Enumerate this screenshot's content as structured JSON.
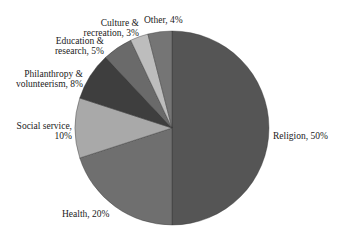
{
  "chart_data": {
    "type": "pie",
    "title": "",
    "start_angle": "12 o'clock",
    "direction": "clockwise",
    "categories": [
      "Religion",
      "Health",
      "Social service",
      "Philanthropy & volunteerism",
      "Education & research",
      "Culture & recreation",
      "Other"
    ],
    "values": [
      50,
      20,
      10,
      8,
      5,
      3,
      4
    ],
    "unit": "%",
    "colors": [
      "#555555",
      "#6f6f6f",
      "#a9a9a9",
      "#3e3e3e",
      "#6a6a6a",
      "#bdbdbd",
      "#757575"
    ],
    "legend": "none (direct labels)"
  },
  "labels": {
    "religion": "Religion, 50%",
    "health": "Health, 20%",
    "social_line1": "Social service,",
    "social_line2": "10%",
    "philanthropy_line1": "Philanthropy &",
    "philanthropy_line2": "volunteerism, 8%",
    "education_line1": "Education &",
    "education_line2": "research, 5%",
    "culture_line1": "Culture &",
    "culture_line2": "recreation, 3%",
    "other": "Other, 4%"
  }
}
